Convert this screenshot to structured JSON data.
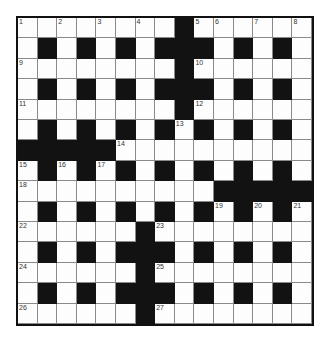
{
  "puzzle": {
    "type": "crossword",
    "size": {
      "rows": 15,
      "cols": 15
    },
    "colors": {
      "block": "#121212",
      "cell": "#fdfdfd",
      "line": "#8a8a8a",
      "border": "#111111",
      "number": "#333333"
    },
    "grid": [
      "........#......",
      ".#.#.#.###.#.#.",
      "........#......",
      ".#.#.#.###.#.#.",
      "........#......",
      ".#.#.#.#.#.#.#.",
      "#####..........",
      ".#.#.#.#.#.#.#.",
      "..........#####",
      ".#.#.#.#.#.#.#.",
      "......#........",
      ".#.#.###.#.#.#.",
      "......#........",
      ".#.#.###.#.#.#.",
      "......#........"
    ],
    "numbers": [
      {
        "n": "1",
        "r": 0,
        "c": 0
      },
      {
        "n": "2",
        "r": 0,
        "c": 2
      },
      {
        "n": "3",
        "r": 0,
        "c": 4
      },
      {
        "n": "4",
        "r": 0,
        "c": 6
      },
      {
        "n": "5",
        "r": 0,
        "c": 9
      },
      {
        "n": "6",
        "r": 0,
        "c": 10
      },
      {
        "n": "7",
        "r": 0,
        "c": 12
      },
      {
        "n": "8",
        "r": 0,
        "c": 14
      },
      {
        "n": "9",
        "r": 2,
        "c": 0
      },
      {
        "n": "10",
        "r": 2,
        "c": 9
      },
      {
        "n": "11",
        "r": 4,
        "c": 0
      },
      {
        "n": "12",
        "r": 4,
        "c": 9
      },
      {
        "n": "13",
        "r": 5,
        "c": 8
      },
      {
        "n": "14",
        "r": 6,
        "c": 5
      },
      {
        "n": "15",
        "r": 7,
        "c": 0
      },
      {
        "n": "16",
        "r": 7,
        "c": 2
      },
      {
        "n": "17",
        "r": 7,
        "c": 4
      },
      {
        "n": "18",
        "r": 8,
        "c": 0
      },
      {
        "n": "19",
        "r": 9,
        "c": 10
      },
      {
        "n": "20",
        "r": 9,
        "c": 12
      },
      {
        "n": "21",
        "r": 9,
        "c": 14
      },
      {
        "n": "22",
        "r": 10,
        "c": 0
      },
      {
        "n": "23",
        "r": 10,
        "c": 7
      },
      {
        "n": "24",
        "r": 12,
        "c": 0
      },
      {
        "n": "25",
        "r": 12,
        "c": 7
      },
      {
        "n": "26",
        "r": 14,
        "c": 0
      },
      {
        "n": "27",
        "r": 14,
        "c": 7
      }
    ]
  }
}
